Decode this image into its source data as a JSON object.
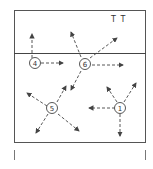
{
  "diagram": {
    "corner_label": "T T",
    "nodes": [
      {
        "id": "4",
        "label": "④",
        "x": 34,
        "y": 63
      },
      {
        "id": "6",
        "label": "⑥",
        "x": 84,
        "y": 63
      },
      {
        "id": "5",
        "label": "⑤",
        "x": 52,
        "y": 108
      },
      {
        "id": "1",
        "label": "①",
        "x": 120,
        "y": 108
      }
    ],
    "colors": {
      "line": "#444444",
      "background": "#ffffff"
    }
  }
}
